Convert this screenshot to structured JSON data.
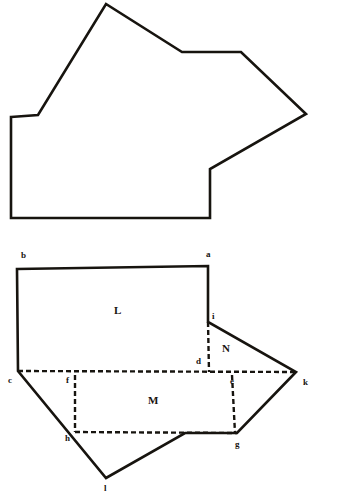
{
  "page": {
    "width": 362,
    "height": 495,
    "background_color": "#ffffff",
    "ink_color": "#17140f"
  },
  "figures": [
    {
      "id": "upper-figure",
      "name": "irregular-polygon-outline",
      "description": "Closed irregular polygon drawn with solid hand-inked lines",
      "line_style": "solid",
      "stroke_color": "#17140f",
      "stroke_width": 2.6,
      "points": "11,117 38,115 106,4 182,52 241,52 306,114 210,169 210,218 11,218",
      "labels": []
    },
    {
      "id": "lower-figure",
      "name": "dissected-polygon-diagram",
      "description": "Same polygon shown dissected into lettered regions L, M and N with vertex letters",
      "outline": {
        "name": "lower-outline-solid",
        "line_style": "solid",
        "stroke_color": "#17140f",
        "stroke_width": 2.6,
        "points": "17,269 208,266 208,322 296,372 237,433 185,433 106,478 18,371"
      },
      "solid_segments": [
        {
          "name": "segment-b-a",
          "points": "17,269 208,266"
        },
        {
          "name": "segment-a-i",
          "points": "208,266 208,322"
        },
        {
          "name": "segment-i-k",
          "points": "208,322 296,372"
        },
        {
          "name": "segment-k-g",
          "points": "296,372 237,433"
        },
        {
          "name": "segment-g-bend",
          "points": "237,433 185,433"
        },
        {
          "name": "segment-bend-l",
          "points": "185,433 106,478"
        },
        {
          "name": "segment-l-c",
          "points": "106,478 18,371"
        },
        {
          "name": "segment-c-b",
          "points": "18,371 17,269"
        }
      ],
      "dashed_segments": [
        {
          "name": "segment-c-k-dashed",
          "points": "18,371 296,372"
        },
        {
          "name": "segment-i-d-dashed",
          "points": "208,322 209,372"
        },
        {
          "name": "segment-f-h-dashed",
          "points": "75,375 75,432"
        },
        {
          "name": "segment-h-g-dashed",
          "points": "75,432 237,433"
        },
        {
          "name": "segment-e-g-dashed",
          "points": "232,375 235,433"
        }
      ],
      "vertex_labels": [
        {
          "name": "vertex-label-b",
          "text": "b",
          "x": 21,
          "y": 258
        },
        {
          "name": "vertex-label-a",
          "text": "a",
          "x": 206,
          "y": 257
        },
        {
          "name": "vertex-label-i",
          "text": "i",
          "x": 212,
          "y": 319
        },
        {
          "name": "vertex-label-d",
          "text": "d",
          "x": 196,
          "y": 364
        },
        {
          "name": "vertex-label-c",
          "text": "c",
          "x": 8,
          "y": 383
        },
        {
          "name": "vertex-label-f",
          "text": "f",
          "x": 66,
          "y": 383
        },
        {
          "name": "vertex-label-e",
          "text": "e",
          "x": 230,
          "y": 384
        },
        {
          "name": "vertex-label-k",
          "text": "k",
          "x": 303,
          "y": 385
        },
        {
          "name": "vertex-label-h",
          "text": "h",
          "x": 65,
          "y": 441
        },
        {
          "name": "vertex-label-g",
          "text": "g",
          "x": 235,
          "y": 447
        },
        {
          "name": "vertex-label-l",
          "text": "l",
          "x": 104,
          "y": 491
        }
      ],
      "region_labels": [
        {
          "name": "region-label-L",
          "text": "L",
          "x": 114,
          "y": 314
        },
        {
          "name": "region-label-N",
          "text": "N",
          "x": 222,
          "y": 352
        },
        {
          "name": "region-label-M",
          "text": "M",
          "x": 148,
          "y": 404
        }
      ]
    }
  ]
}
